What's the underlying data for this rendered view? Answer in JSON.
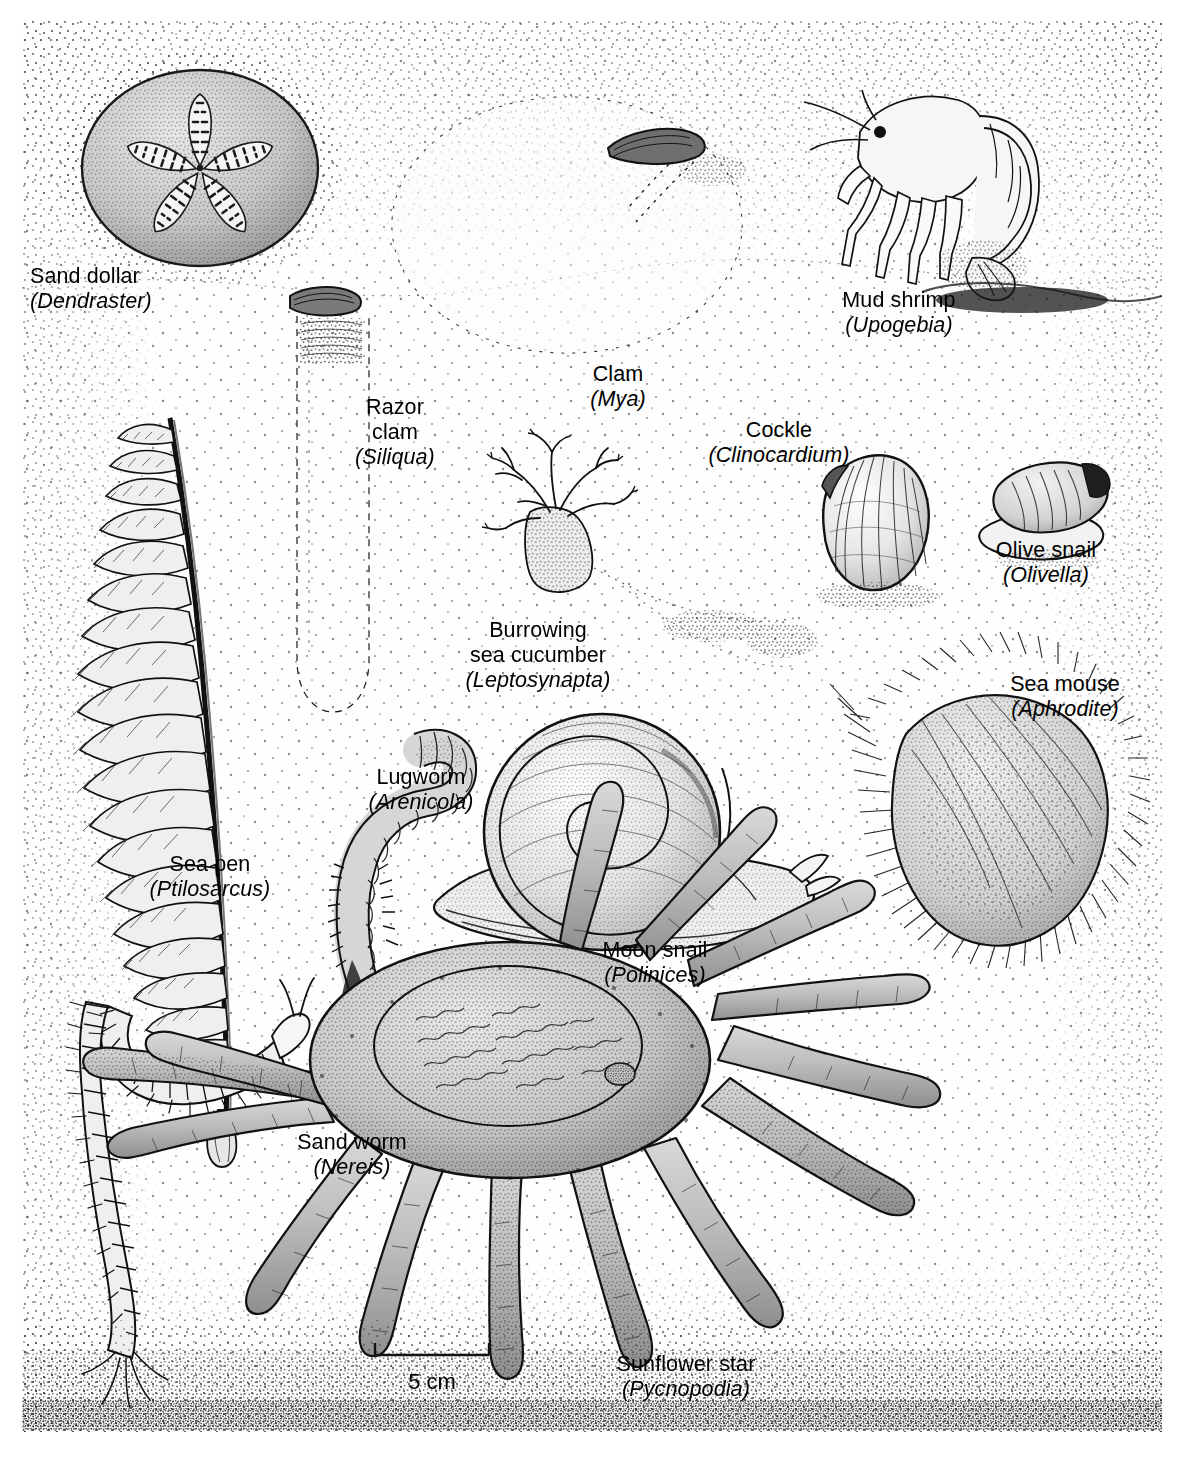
{
  "figure": {
    "kind": "scientific-illustration",
    "background_color": "#ffffff",
    "ink_color": "#1a1a1a"
  },
  "scale": {
    "label": "5 cm",
    "bar_value": 5,
    "bar_units": "cm"
  },
  "organisms": [
    {
      "id": "sand-dollar",
      "common_name": "Sand dollar",
      "genus": "Dendraster",
      "label_lines": [
        "Sand dollar",
        "(Dendraster)"
      ],
      "align": "left",
      "label_x": 30,
      "label_y": 264,
      "habit": "epifaunal, partly buried disc"
    },
    {
      "id": "mud-shrimp",
      "common_name": "Mud shrimp",
      "genus": "Upogebia",
      "label_lines": [
        "Mud shrimp",
        "(Upogebia)"
      ],
      "align": "center",
      "label_x": 809,
      "label_y": 288,
      "habit": "burrow dweller"
    },
    {
      "id": "razor-clam",
      "common_name": "Razor clam",
      "genus": "Siliqua",
      "label_lines": [
        "Razor",
        "clam",
        "(Siliqua)"
      ],
      "align": "center",
      "label_x": 340,
      "label_y": 395,
      "habit": "deep burrower, vertical"
    },
    {
      "id": "clam",
      "common_name": "Clam",
      "genus": "Mya",
      "label_lines": [
        "Clam",
        "(Mya)"
      ],
      "align": "center",
      "label_x": 568,
      "label_y": 362,
      "habit": "deep burrower with long siphon"
    },
    {
      "id": "cockle",
      "common_name": "Cockle",
      "genus": "Clinocardium",
      "label_lines": [
        "Cockle",
        "(Clinocardium)"
      ],
      "align": "center",
      "label_x": 694,
      "label_y": 418,
      "habit": "shallow burrower"
    },
    {
      "id": "olive-snail",
      "common_name": "Olive snail",
      "genus": "Olivella",
      "label_lines": [
        "Olive snail",
        "(Olivella)"
      ],
      "align": "center",
      "label_x": 970,
      "label_y": 538,
      "habit": "sand plougher"
    },
    {
      "id": "burrowing-sea-cucumber",
      "common_name": "Burrowing sea cucumber",
      "genus": "Leptosynapta",
      "label_lines": [
        "Burrowing",
        "sea cucumber",
        "(Leptosynapta)"
      ],
      "align": "center",
      "label_x": 438,
      "label_y": 618,
      "habit": "infaunal deposit feeder"
    },
    {
      "id": "sea-mouse",
      "common_name": "Sea mouse",
      "genus": "Aphrodite",
      "label_lines": [
        "Sea mouse",
        "(Aphrodite)"
      ],
      "align": "center",
      "label_x": 990,
      "label_y": 672,
      "habit": "bristly scale worm"
    },
    {
      "id": "lugworm",
      "common_name": "Lugworm",
      "genus": "Arenicola",
      "label_lines": [
        "Lugworm",
        "(Arenicola)"
      ],
      "align": "center",
      "label_x": 350,
      "label_y": 765,
      "habit": "U-burrow deposit feeder"
    },
    {
      "id": "sea-pen",
      "common_name": "Sea pen",
      "genus": "Ptilosarcus",
      "label_lines": [
        "Sea pen",
        "(Ptilosarcus)"
      ],
      "align": "center",
      "label_x": 130,
      "label_y": 852,
      "habit": "colonial octocoral anchored in sediment"
    },
    {
      "id": "moon-snail",
      "common_name": "Moon snail",
      "genus": "Polinices",
      "label_lines": [
        "Moon snail",
        "(Polinices)"
      ],
      "align": "center",
      "label_x": 580,
      "label_y": 938,
      "habit": "predatory gastropod"
    },
    {
      "id": "sand-worm",
      "common_name": "Sand worm",
      "genus": "Nereis",
      "label_lines": [
        "Sand worm",
        "(Nereis)"
      ],
      "align": "center",
      "label_x": 276,
      "label_y": 1130,
      "habit": "errant polychaete"
    },
    {
      "id": "sunflower-star",
      "common_name": "Sunflower star",
      "genus": "Pycnopodia",
      "label_lines": [
        "Sunflower star",
        "(Pycnopodia)"
      ],
      "align": "center",
      "label_x": 586,
      "label_y": 1352,
      "habit": "many-armed predatory sea star"
    }
  ]
}
